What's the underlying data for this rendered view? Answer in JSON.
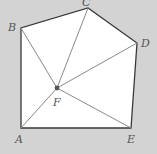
{
  "diagram": {
    "type": "geometry",
    "colors": {
      "background": "#d3d3d3",
      "fill": "#ffffff",
      "outline": "#3a3a3a",
      "inner_lines": "#8a8a8a",
      "point": "#555555",
      "label": "#555555"
    },
    "vertices": {
      "A": {
        "x": 21,
        "y": 128,
        "label": "A",
        "lx": 15,
        "ly": 143
      },
      "B": {
        "x": 21,
        "y": 28,
        "label": "B",
        "lx": 8,
        "ly": 31
      },
      "C": {
        "x": 88,
        "y": 8,
        "label": "C",
        "lx": 82,
        "ly": 6
      },
      "D": {
        "x": 137,
        "y": 43,
        "label": "D",
        "lx": 141,
        "ly": 47
      },
      "E": {
        "x": 131,
        "y": 128,
        "label": "E",
        "lx": 127,
        "ly": 143
      },
      "F": {
        "x": 57,
        "y": 88,
        "label": "F",
        "lx": 53,
        "ly": 106
      }
    },
    "polygon": [
      "A",
      "B",
      "C",
      "D",
      "E"
    ],
    "segments": [
      [
        "F",
        "A"
      ],
      [
        "F",
        "B"
      ],
      [
        "F",
        "C"
      ],
      [
        "F",
        "D"
      ],
      [
        "F",
        "E"
      ]
    ]
  }
}
